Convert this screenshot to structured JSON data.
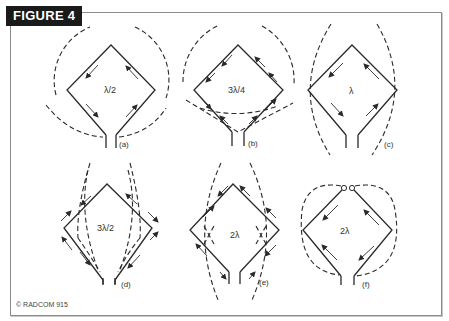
{
  "figure": {
    "title": "FIGURE 4",
    "credit": "© RADCOM 915"
  },
  "panels": [
    {
      "id": "a",
      "label": "(a)",
      "loop_length": "λ/2"
    },
    {
      "id": "b",
      "label": "(b)",
      "loop_length": "3λ/4"
    },
    {
      "id": "c",
      "label": "(c)",
      "loop_length": "λ"
    },
    {
      "id": "d",
      "label": "(d)",
      "loop_length": "3λ/2"
    },
    {
      "id": "e",
      "label": "(e)",
      "loop_length": "2λ"
    },
    {
      "id": "f",
      "label": "(f)",
      "loop_length": "2λ"
    }
  ],
  "colors": {
    "title_bg": "#1a1a1a",
    "title_fg": "#ffffff",
    "line": "#2a2a2a",
    "frame": "#8a8a8a"
  }
}
